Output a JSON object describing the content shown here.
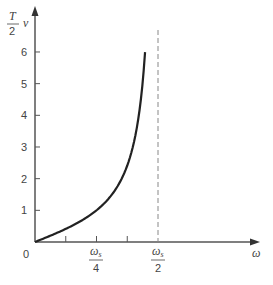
{
  "chart_data": {
    "type": "line",
    "title": "",
    "xlabel": "ω",
    "ylabel": "T/2 ν",
    "ylabel_parts": {
      "num": "T",
      "den": "2",
      "var": "ν"
    },
    "ylim": [
      0,
      6.5
    ],
    "yticks": [
      {
        "value": 1,
        "label": "1"
      },
      {
        "value": 2,
        "label": "2"
      },
      {
        "value": 3,
        "label": "3"
      },
      {
        "value": 4,
        "label": "4"
      },
      {
        "value": 5,
        "label": "5"
      },
      {
        "value": 6,
        "label": "6"
      }
    ],
    "origin_label": "0",
    "xticks": [
      {
        "fraction": 0.125,
        "label": ""
      },
      {
        "fraction": 0.25,
        "label": "ωs/4",
        "num": "ωs",
        "den": "4"
      },
      {
        "fraction": 0.375,
        "label": ""
      },
      {
        "fraction": 0.5,
        "label": "ωs/2",
        "num": "ωs",
        "den": "2"
      }
    ],
    "asymptote": {
      "x": "ωs/2",
      "style": "dashed"
    },
    "series": [
      {
        "name": "(T/2)ν = tan(πω/ωs)",
        "x_fraction_of_ws": [
          0,
          0.05,
          0.1,
          0.15,
          0.2,
          0.25,
          0.3,
          0.35,
          0.4,
          0.42,
          0.44,
          0.4474
        ],
        "values": [
          0,
          0.16,
          0.32,
          0.51,
          0.73,
          1.0,
          1.38,
          1.96,
          3.08,
          3.89,
          5.3,
          6.0
        ]
      }
    ],
    "grid": false,
    "legend": null
  }
}
